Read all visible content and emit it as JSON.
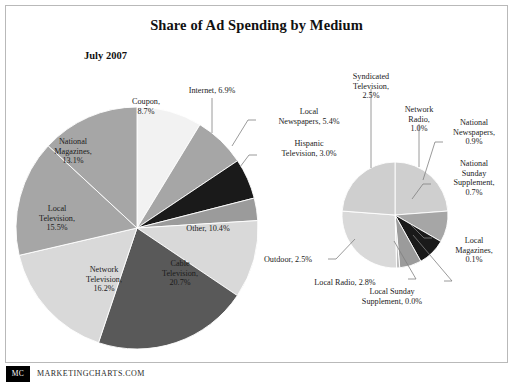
{
  "title": "Share of Ad Spending by Medium",
  "subtitle": "July 2007",
  "footer": {
    "badge": "MC",
    "url": "MARKETINGCHARTS.COM"
  },
  "colors": {
    "very_light": "#f2f2f2",
    "light": "#d9d9d9",
    "light_mid": "#cfcfcf",
    "mid": "#a6a6a6",
    "mid_gray": "#9b9b9b",
    "dark": "#595959",
    "black": "#1a1a1a",
    "border": "#b9b9b9",
    "text": "#1b1b1b",
    "leader": "#808080"
  },
  "chart_data": [
    {
      "type": "pie",
      "name": "main-pie",
      "title": "Share of Ad Spending by Medium",
      "subtitle": "July 2007",
      "unit": "%",
      "categories": [
        "Coupon",
        "Internet",
        "Local Newspapers",
        "Hispanic Television",
        "Other",
        "Cable Television",
        "Network Television",
        "Local Television",
        "National Magazines"
      ],
      "values": [
        8.7,
        6.9,
        5.4,
        3.0,
        10.4,
        20.7,
        16.2,
        15.5,
        13.1
      ],
      "labels": [
        "Coupon, 8.7%",
        "Internet, 6.9%",
        "Local Newspapers, 5.4%",
        "Hispanic Television, 3.0%",
        "Other, 10.4%",
        "Cable Television, 20.7%",
        "Network Television, 16.2%",
        "Local Television, 15.5%",
        "National Magazines, 13.1%"
      ],
      "slice_colors": [
        "#f2f2f2",
        "#a6a6a6",
        "#1a1a1a",
        "#9b9b9b",
        "#d9d9d9",
        "#595959",
        "#d9d9d9",
        "#a6a6a6",
        "#a6a6a6"
      ],
      "start_angle": 0,
      "direction": "clockwise",
      "legend": "none"
    },
    {
      "type": "pie",
      "name": "detail-pie",
      "title": "",
      "unit": "%",
      "categories": [
        "Syndicated Television",
        "Network Radio",
        "National Newspapers",
        "National Sunday Supplement",
        "Local Magazines",
        "Local Sunday Supplement",
        "Local Radio",
        "Outdoor"
      ],
      "values": [
        2.5,
        1.0,
        0.9,
        0.7,
        0.1,
        0.0,
        2.8,
        2.5
      ],
      "labels": [
        "Syndicated Television, 2.5%",
        "Network Radio, 1.0%",
        "National Newspapers, 0.9%",
        "National Sunday Supplement, 0.7%",
        "Local Magazines, 0.1%",
        "Local Sunday Supplement, 0.0%",
        "Local Radio, 2.8%",
        "Outdoor, 2.5%"
      ],
      "slice_colors": [
        "#cfcfcf",
        "#a6a6a6",
        "#1a1a1a",
        "#9b9b9b",
        "#bdbdbd",
        "#cfcfcf",
        "#d9d9d9",
        "#cfcfcf"
      ],
      "start_angle": 0,
      "direction": "clockwise",
      "legend": "none"
    }
  ],
  "main_pie_labels": [
    {
      "id": "coupon",
      "lines": [
        "Coupon,",
        "8.7%"
      ],
      "x": 146,
      "y": 104,
      "anchor": "middle",
      "callout": false
    },
    {
      "id": "national-magazines",
      "lines": [
        "National",
        "Magazines,",
        "13.1%"
      ],
      "x": 73,
      "y": 144,
      "anchor": "middle",
      "callout": false
    },
    {
      "id": "local-television",
      "lines": [
        "Local",
        "Television,",
        "15.5%"
      ],
      "x": 57,
      "y": 211,
      "anchor": "middle",
      "callout": false
    },
    {
      "id": "network-television",
      "lines": [
        "Network",
        "Television,",
        "16.2%"
      ],
      "x": 104,
      "y": 272,
      "anchor": "middle",
      "callout": false
    },
    {
      "id": "cable-television",
      "lines": [
        "Cable",
        "Television,",
        "20.7%"
      ],
      "x": 180,
      "y": 266,
      "anchor": "middle",
      "callout": false
    },
    {
      "id": "other",
      "lines": [
        "Other, 10.4%"
      ],
      "x": 208,
      "y": 231,
      "anchor": "middle",
      "callout": false
    },
    {
      "id": "internet",
      "lines": [
        "Internet, 6.9%"
      ],
      "x": 212,
      "y": 93,
      "anchor": "middle",
      "callout": true
    },
    {
      "id": "local-newspapers",
      "lines": [
        "Local",
        "Newspapers, 5.4%"
      ],
      "x": 309,
      "y": 114,
      "anchor": "middle",
      "callout": true
    },
    {
      "id": "hispanic-television",
      "lines": [
        "Hispanic",
        "Television, 3.0%"
      ],
      "x": 309,
      "y": 146,
      "anchor": "middle",
      "callout": true
    }
  ],
  "detail_pie_labels": [
    {
      "id": "syndicated-television",
      "lines": [
        "Syndicated",
        "Television,",
        "2.5%"
      ],
      "x": 371,
      "y": 79,
      "anchor": "middle",
      "callout": true
    },
    {
      "id": "network-radio",
      "lines": [
        "Network",
        "Radio,",
        "1.0%"
      ],
      "x": 419,
      "y": 112,
      "anchor": "middle",
      "callout": true
    },
    {
      "id": "national-newspapers",
      "lines": [
        "National",
        "Newspapers,",
        "0.9%"
      ],
      "x": 474,
      "y": 125,
      "anchor": "middle",
      "callout": true
    },
    {
      "id": "national-sunday-supplement",
      "lines": [
        "National",
        "Sunday",
        "Supplement,",
        "0.7%"
      ],
      "x": 474,
      "y": 166,
      "anchor": "middle",
      "callout": true
    },
    {
      "id": "local-magazines",
      "lines": [
        "Local",
        "Magazines,",
        "0.1%"
      ],
      "x": 474,
      "y": 243,
      "anchor": "middle",
      "callout": true
    },
    {
      "id": "local-sunday-supplement",
      "lines": [
        "Local Sunday",
        "Supplement, 0.0%"
      ],
      "x": 392,
      "y": 294,
      "anchor": "middle",
      "callout": true
    },
    {
      "id": "local-radio",
      "lines": [
        "Local Radio, 2.8%"
      ],
      "x": 345,
      "y": 285,
      "anchor": "middle",
      "callout": true
    },
    {
      "id": "outdoor",
      "lines": [
        "Outdoor, 2.5%"
      ],
      "x": 288,
      "y": 262,
      "anchor": "middle",
      "callout": true
    }
  ],
  "main_pie_geometry": {
    "cx": 137,
    "cy": 228,
    "r": 121
  },
  "detail_pie_geometry": {
    "cx": 395,
    "cy": 215,
    "r": 53
  },
  "leader_lines": [
    {
      "id": "internet-leader",
      "points": "212,98 212,133"
    },
    {
      "id": "local-newspapers-leader",
      "points": "256,120 248,120 232,146"
    },
    {
      "id": "hispanic-television-leader",
      "points": "257,155 249,155 240,167"
    },
    {
      "id": "syndicated-television-leader",
      "points": "371,89 371,168"
    },
    {
      "id": "network-radio-leader",
      "points": "419,124 419,167"
    },
    {
      "id": "national-newspapers-leader",
      "points": "443,142 435,142 423,180"
    },
    {
      "id": "national-sunday-supplement-leader",
      "points": "431,184 423,184 412,199"
    },
    {
      "id": "local-magazines-leader",
      "points": "432,238 424,238 410,224"
    },
    {
      "id": "local-sunday-supplement-leader",
      "points": "444,281 452,281 413,235"
    },
    {
      "id": "local-radio-leader",
      "points": "408,279 416,279 394,241"
    },
    {
      "id": "outdoor-leader",
      "points": "328,259 336,259 355,239"
    }
  ]
}
